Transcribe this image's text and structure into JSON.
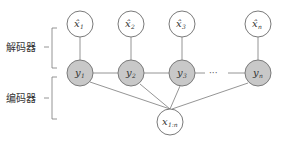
{
  "diagram": {
    "labels": {
      "decoder": "解码器",
      "encoder": "编码器"
    },
    "colors": {
      "stroke": "#7a7a7a",
      "hidden_fill": "#c8c8c8",
      "observed_fill": "#ffffff",
      "text": "#333333"
    },
    "output_nodes": [
      {
        "id": "xhat1",
        "base": "x̂",
        "sub": "1"
      },
      {
        "id": "xhat2",
        "base": "x̂",
        "sub": "2"
      },
      {
        "id": "xhat3",
        "base": "x̂",
        "sub": "3"
      },
      {
        "id": "xhatn",
        "base": "x̂",
        "sub": "n"
      }
    ],
    "latent_nodes": [
      {
        "id": "y1",
        "base": "y",
        "sub": "1"
      },
      {
        "id": "y2",
        "base": "y",
        "sub": "2"
      },
      {
        "id": "y3",
        "base": "y",
        "sub": "3"
      },
      {
        "id": "yn",
        "base": "y",
        "sub": "n"
      }
    ],
    "ellipsis": "···",
    "input_node": {
      "id": "x1n",
      "base": "x",
      "sub": "1:n"
    }
  }
}
